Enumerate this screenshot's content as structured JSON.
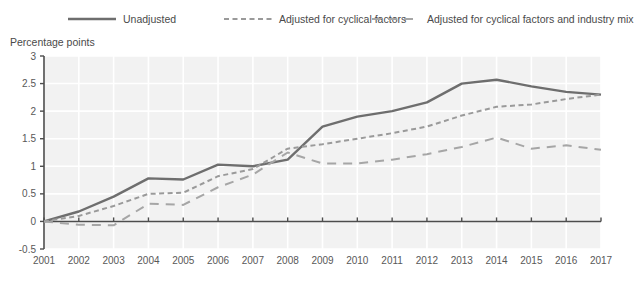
{
  "legend": {
    "items": [
      {
        "label": "Unadjusted",
        "style": "solid",
        "color": "#6e6e6e",
        "icon": "line-swatch-solid-icon"
      },
      {
        "label": "Adjusted for cyclical factors",
        "style": "short-dash",
        "color": "#9a9a9a",
        "icon": "line-swatch-short-dash-icon"
      },
      {
        "label": "Adjusted for cyclical factors and industry mix",
        "style": "long-dash",
        "color": "#a6a6a6",
        "icon": "line-swatch-long-dash-icon"
      }
    ]
  },
  "axis": {
    "y_unit_label": "Percentage points"
  },
  "chart_data": {
    "type": "line",
    "title": "",
    "subtitle": "",
    "xlabel": "",
    "ylabel": "Percentage points",
    "x": [
      2001,
      2002,
      2003,
      2004,
      2005,
      2006,
      2007,
      2008,
      2009,
      2010,
      2011,
      2012,
      2013,
      2014,
      2015,
      2016,
      2017
    ],
    "xtick_labels": [
      "2001",
      "2002",
      "2003",
      "2004",
      "2005",
      "2006",
      "2007",
      "2008",
      "2009",
      "2010",
      "2011",
      "2012",
      "2013",
      "2014",
      "2015",
      "2016",
      "2017"
    ],
    "ylim": [
      -0.5,
      3
    ],
    "ytick_values": [
      -0.5,
      0,
      0.5,
      1,
      1.5,
      2,
      2.5,
      3
    ],
    "ytick_labels": [
      "-0.5",
      "0",
      "0.5",
      "1",
      "1.5",
      "2",
      "2.5",
      "3"
    ],
    "grid": true,
    "legend_position": "top",
    "series": [
      {
        "name": "Unadjusted",
        "style": "solid",
        "color": "#6e6e6e",
        "values": [
          0.0,
          0.18,
          0.45,
          0.78,
          0.76,
          1.03,
          1.0,
          1.12,
          1.72,
          1.9,
          2.0,
          2.16,
          2.5,
          2.57,
          2.45,
          2.35,
          2.3
        ]
      },
      {
        "name": "Adjusted for cyclical factors",
        "style": "short-dash",
        "color": "#9a9a9a",
        "values": [
          0.0,
          0.1,
          0.28,
          0.5,
          0.52,
          0.82,
          0.95,
          1.32,
          1.4,
          1.5,
          1.6,
          1.72,
          1.92,
          2.08,
          2.12,
          2.22,
          2.3
        ]
      },
      {
        "name": "Adjusted for cyclical factors and industry mix",
        "style": "long-dash",
        "color": "#a6a6a6",
        "values": [
          0.0,
          -0.06,
          -0.07,
          0.32,
          0.3,
          0.62,
          0.85,
          1.25,
          1.05,
          1.05,
          1.12,
          1.22,
          1.35,
          1.52,
          1.32,
          1.38,
          1.3
        ]
      }
    ]
  }
}
